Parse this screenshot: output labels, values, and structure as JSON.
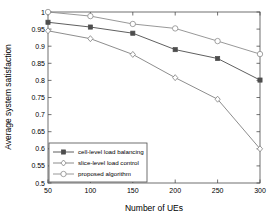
{
  "chart_data": {
    "type": "line",
    "title": "",
    "xlabel": "Number of UEs",
    "ylabel": "Average system satisfaction",
    "x": [
      50,
      100,
      150,
      200,
      250,
      300
    ],
    "xtick_labels": [
      "50",
      "100",
      "150",
      "200",
      "250",
      "300"
    ],
    "ytick_labels": [
      "0.5",
      "0.55",
      "0.6",
      "0.65",
      "0.7",
      "0.75",
      "0.8",
      "0.85",
      "0.9",
      "0.95",
      "1"
    ],
    "ytick_values": [
      0.5,
      0.55,
      0.6,
      0.65,
      0.7,
      0.75,
      0.8,
      0.85,
      0.9,
      0.95,
      1.0
    ],
    "xlim": [
      50,
      300
    ],
    "ylim": [
      0.5,
      1.0
    ],
    "grid": false,
    "legend_position": "lower left",
    "series": [
      {
        "name": "cell-level load balancing",
        "marker": "square-filled",
        "color": "#4d4d4d",
        "values": [
          0.97,
          0.956,
          0.938,
          0.89,
          0.864,
          0.801
        ]
      },
      {
        "name": "slice-level load control",
        "marker": "diamond-open",
        "color": "#808080",
        "values": [
          0.945,
          0.922,
          0.876,
          0.808,
          0.745,
          0.6
        ]
      },
      {
        "name": "proposed algorithm",
        "marker": "circle-open",
        "color": "#8c8c8c",
        "values": [
          1.0,
          0.988,
          0.965,
          0.952,
          0.915,
          0.877
        ]
      }
    ]
  },
  "legend": {
    "entries": [
      "cell-level load balancing",
      "slice-level load control",
      "proposed algorithm"
    ]
  },
  "axes": {
    "x_title": "Number of UEs",
    "y_title": "Average system satisfaction"
  }
}
